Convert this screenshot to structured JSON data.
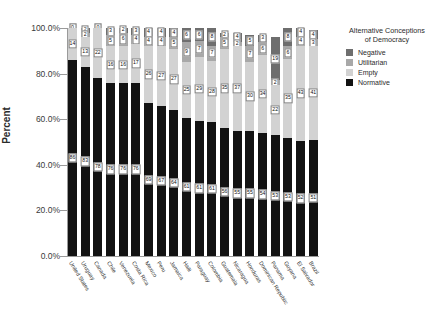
{
  "chart": {
    "type": "bar",
    "axis_title_y": "Percent",
    "y_ticks": [
      "100.0%",
      "80.0%",
      "60.0%",
      "40.0%",
      "20.0%",
      "0.0%"
    ]
  },
  "legend": {
    "title_line1": "Alternative Conceptions",
    "title_line2": "of Democracy",
    "items": [
      {
        "label": "Negative",
        "color": "#6e6e6e"
      },
      {
        "label": "Utilitarian",
        "color": "#a8a8a8"
      },
      {
        "label": "Empty",
        "color": "#d2d2d2"
      },
      {
        "label": "Normative",
        "color": "#121212"
      }
    ]
  },
  "chart_data": {
    "type": "bar",
    "stacked": true,
    "normalized_percent": true,
    "title": "",
    "xlabel": "",
    "ylabel": "Percent",
    "ylim": [
      0,
      100
    ],
    "grid": false,
    "legend_position": "right",
    "legend_title": "Alternative Conceptions of Democracy",
    "categories": [
      "United States",
      "Uruguay",
      "Canada",
      "Chile",
      "Venezuela",
      "Costa Rica",
      "Mexico",
      "Peru",
      "Jamaica",
      "Haiti",
      "Paraguay",
      "Colombia",
      "Guatemala",
      "Nicaragua",
      "Honduras",
      "Dominican Republic",
      "Panama",
      "Guyana",
      "El Salvador",
      "Brazil"
    ],
    "series": [
      {
        "name": "Normative",
        "color": "#121212",
        "values": [
          86,
          83,
          78,
          76,
          76,
          76,
          69,
          67,
          64,
          61,
          61,
          61,
          56,
          55,
          55,
          54,
          53,
          53,
          52,
          51
        ]
      },
      {
        "name": "Empty",
        "color": "#d2d2d2",
        "values": [
          14,
          13,
          22,
          16,
          16,
          17,
          26,
          27,
          27,
          25,
          29,
          28,
          35,
          37,
          30,
          34,
          22,
          35,
          43,
          41
        ]
      },
      {
        "name": "Utilitarian",
        "color": "#a8a8a8",
        "values": [
          0,
          2,
          0,
          5,
          6,
          4,
          4,
          4,
          5,
          9,
          7,
          7,
          5,
          2,
          7,
          6,
          2,
          6,
          4,
          3
        ]
      },
      {
        "name": "Negative",
        "color": "#6e6e6e",
        "values": [
          0,
          2,
          0,
          3,
          2,
          3,
          4,
          4,
          4,
          6,
          6,
          8,
          2,
          4,
          5,
          3,
          19,
          8,
          4,
          4
        ]
      }
    ]
  }
}
